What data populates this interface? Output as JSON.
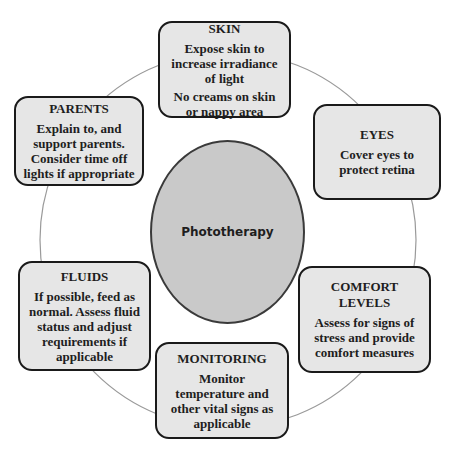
{
  "diagram": {
    "center": {
      "label": "Phototherapy"
    },
    "nodes": [
      {
        "id": "skin",
        "title": "SKIN",
        "lines": [
          "Expose skin to",
          "increase irradiance",
          "of light",
          "No creams on skin",
          "or nappy area"
        ]
      },
      {
        "id": "eyes",
        "title": "EYES",
        "lines": [
          "Cover eyes to",
          "protect retina"
        ]
      },
      {
        "id": "comfort",
        "title": "COMFORT LEVELS",
        "title_lines": [
          "COMFORT",
          "LEVELS"
        ],
        "lines": [
          "Assess for signs of",
          "stress and provide",
          "comfort measures"
        ]
      },
      {
        "id": "monitoring",
        "title": "MONITORING",
        "lines": [
          "Monitor",
          "temperature and",
          "other vital signs as",
          "applicable"
        ]
      },
      {
        "id": "fluids",
        "title": "FLUIDS",
        "lines": [
          "If possible, feed as",
          "normal. Assess fluid",
          "status and adjust",
          "requirements if",
          "applicable"
        ]
      },
      {
        "id": "parents",
        "title": "PARENTS",
        "lines": [
          "Explain to, and",
          "support parents.",
          "Consider time off",
          "lights if appropriate"
        ]
      }
    ],
    "colors": {
      "box_fill": "#e6e6e6",
      "box_border": "#1a1a1a",
      "ellipse_fill": "#c9c9c9",
      "ring_stroke": "#9a9a9a"
    }
  }
}
